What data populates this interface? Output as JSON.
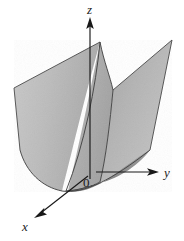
{
  "figure": {
    "background_color": "#ffffff",
    "width": 184,
    "height": 241
  },
  "axes": {
    "origin_label": "0",
    "x_label": "x",
    "y_label": "y",
    "z_label": "z",
    "axis_color": "#181818",
    "origin_point": {
      "x": 92,
      "y": 172
    },
    "z_axis": {
      "from_x": 90,
      "from_y": 178,
      "to_x": 90,
      "to_y": 20,
      "arrow": "up"
    },
    "y_axis": {
      "from_x": 96,
      "from_y": 172,
      "to_x": 158,
      "to_y": 172,
      "arrow": "right"
    },
    "x_axis": {
      "from_x": 88,
      "from_y": 176,
      "to_x": 36,
      "to_y": 216,
      "arrow": "down-left"
    },
    "z_label_pos": {
      "x": 90,
      "y": 14
    },
    "y_label_pos": {
      "x": 166,
      "y": 176
    },
    "x_label_pos": {
      "x": 26,
      "y": 227
    },
    "origin_label_pos": {
      "x": 86,
      "y": 186
    }
  },
  "surface": {
    "kind": "parabolic-cylinder",
    "description": "Parabolic cylinder z = y squared extended along the x axis, shaded gray",
    "fill_light": "#c2c2c2",
    "fill_mid": "#b0b0b0",
    "fill_dark": "#8c8c8c",
    "outline_color": "#4a4a4a",
    "front_parabola_vertex": {
      "x": 60,
      "y": 186
    },
    "back_parabola_vertex": {
      "x": 106,
      "y": 150
    },
    "left_top_corner": {
      "x": 14,
      "y": 88
    },
    "right_top_corner": {
      "x": 172,
      "y": 40
    },
    "inner_top_left": {
      "x": 100,
      "y": 42
    },
    "inner_top_right": {
      "x": 113,
      "y": 90
    }
  }
}
